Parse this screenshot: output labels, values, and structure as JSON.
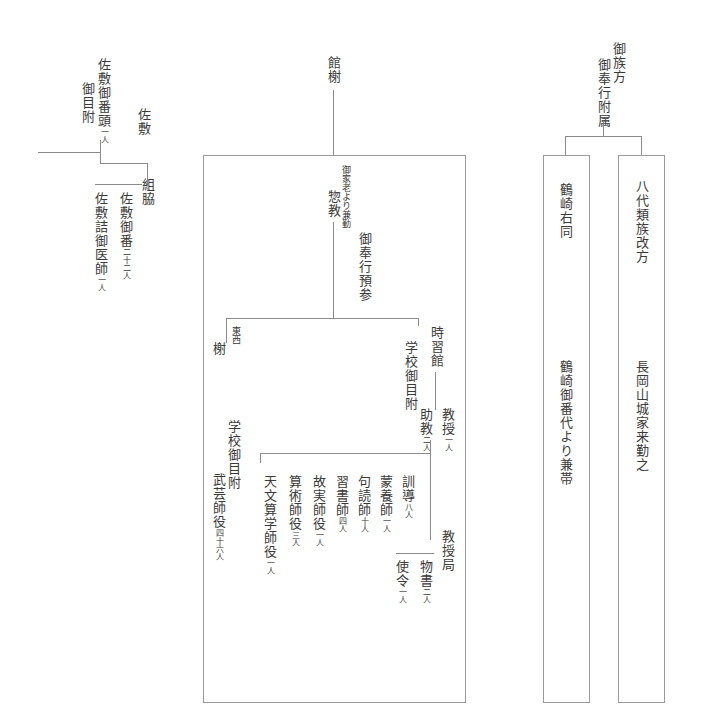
{
  "left": {
    "heading": "佐敷",
    "head_title": "佐敷御番頭",
    "head_count": "一人",
    "head_note": "御目附",
    "group": "組脇",
    "members": [
      {
        "title": "佐敷御番",
        "count": "二十二人"
      },
      {
        "title": "佐敷詰御医師",
        "count": "一人"
      }
    ]
  },
  "center": {
    "heading": "館榭",
    "chief_note": "御家老より兼勤",
    "chief_title": "惣教",
    "chief_sub": "御奉行預参",
    "east_west": "東西",
    "east_west_unit": "榭",
    "east_note": "学校御目附",
    "east_staff": {
      "title": "武芸師役",
      "count": "四十六人"
    },
    "jishukan": "時習館",
    "jishukan_note": "学校御目附",
    "professor": {
      "title": "教授",
      "count": "一人"
    },
    "assistant": {
      "title": "助教",
      "count": "二人"
    },
    "staff": [
      {
        "title": "訓導",
        "count": "八人"
      },
      {
        "title": "蒙養師",
        "count": "一人"
      },
      {
        "title": "句読師",
        "count": "十人"
      },
      {
        "title": "習書師",
        "count": "四人"
      },
      {
        "title": "故実師役",
        "count": "一人"
      },
      {
        "title": "算術師役",
        "count": "三人"
      },
      {
        "title": "天文算学師役",
        "count": "一人"
      }
    ],
    "bureau": "教授局",
    "bureau_staff": [
      {
        "title": "物書",
        "count": "二人"
      },
      {
        "title": "使令",
        "count": "一人"
      }
    ]
  },
  "right": {
    "heading_1": "御族方",
    "heading_2": "御奉行附属",
    "col1_top": "鶴崎右同",
    "col1_bottom": "鶴崎御番代より兼帯",
    "col2_top": "八代類族改方",
    "col2_bottom": "長岡山城家来勤之"
  }
}
